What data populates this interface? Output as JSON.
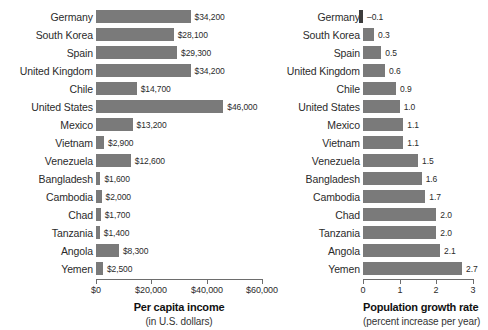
{
  "chart_data": [
    {
      "type": "bar",
      "orientation": "horizontal",
      "panel": "left",
      "title": "Per capita income",
      "subtitle": "(in U.S. dollars)",
      "xlabel": "Per capita income",
      "ylabel": "",
      "xlim": [
        0,
        60000
      ],
      "grid": false,
      "legend": false,
      "tick_labels": [
        "$0",
        "$20,000",
        "$40,000",
        "$60,000"
      ],
      "tick_values": [
        0,
        20000,
        40000,
        60000
      ],
      "bar_color": "#7a7a7a",
      "categories": [
        "Germany",
        "South Korea",
        "Spain",
        "United Kingdom",
        "Chile",
        "United States",
        "Mexico",
        "Vietnam",
        "Venezuela",
        "Bangladesh",
        "Cambodia",
        "Chad",
        "Tanzania",
        "Angola",
        "Yemen"
      ],
      "values": [
        34200,
        28100,
        29300,
        34200,
        14700,
        46000,
        13200,
        2900,
        12600,
        1600,
        2000,
        1700,
        1400,
        8300,
        2500
      ],
      "value_labels": [
        "$34,200",
        "$28,100",
        "$29,300",
        "$34,200",
        "$14,700",
        "$46,000",
        "$13,200",
        "$2,900",
        "$12,600",
        "$1,600",
        "$2,000",
        "$1,700",
        "$1,400",
        "$8,300",
        "$2,500"
      ]
    },
    {
      "type": "bar",
      "orientation": "horizontal",
      "panel": "right",
      "title": "Population growth rate",
      "subtitle": "(percent increase per year)",
      "xlabel": "Population growth rate",
      "ylabel": "",
      "xlim": [
        0,
        3
      ],
      "grid": false,
      "legend": false,
      "tick_labels": [
        "0",
        "1",
        "2",
        "3"
      ],
      "tick_values": [
        0,
        1,
        2,
        3
      ],
      "bar_color": "#7a7a7a",
      "categories": [
        "Germany",
        "South Korea",
        "Spain",
        "United Kingdom",
        "Chile",
        "United States",
        "Mexico",
        "Vietnam",
        "Venezuela",
        "Bangladesh",
        "Cambodia",
        "Chad",
        "Tanzania",
        "Angola",
        "Yemen"
      ],
      "values": [
        -0.1,
        0.3,
        0.5,
        0.6,
        0.9,
        1.0,
        1.1,
        1.1,
        1.5,
        1.6,
        1.7,
        2.0,
        2.0,
        2.1,
        2.7
      ],
      "value_labels": [
        "–0.1",
        "0.3",
        "0.5",
        "0.6",
        "0.9",
        "1.0",
        "1.1",
        "1.1",
        "1.5",
        "1.6",
        "1.7",
        "2.0",
        "2.0",
        "2.1",
        "2.7"
      ]
    }
  ]
}
